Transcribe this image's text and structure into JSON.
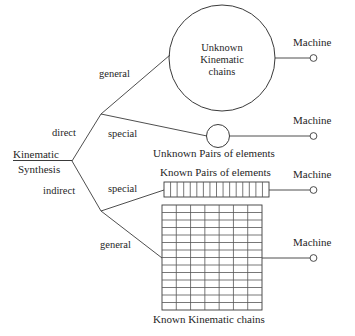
{
  "diagram": {
    "root": {
      "line1": "Kinematic",
      "line2": "Synthesis"
    },
    "branches": [
      {
        "id": "direct",
        "label": "direct"
      },
      {
        "id": "indirect",
        "label": "indirect"
      }
    ],
    "sub_branches": [
      {
        "id": "direct-general",
        "label": "general"
      },
      {
        "id": "direct-special",
        "label": "special"
      },
      {
        "id": "indirect-special",
        "label": "special"
      },
      {
        "id": "indirect-general",
        "label": "general"
      }
    ],
    "nodes": [
      {
        "id": "unknown-kinematic-chains",
        "shape": "large-circle",
        "text_lines": [
          "Unknown",
          "Kinematic",
          "chains"
        ],
        "caption": ""
      },
      {
        "id": "unknown-pairs-of-elements",
        "shape": "small-circle",
        "text_lines": [],
        "caption": "Unknown Pairs of elements"
      },
      {
        "id": "known-pairs-of-elements",
        "shape": "cell-strip",
        "text_lines": [],
        "caption": "Known Pairs of elements",
        "cells": 16
      },
      {
        "id": "known-kinematic-chains",
        "shape": "grid",
        "text_lines": [],
        "caption": "Known Kinematic chains",
        "columns": 7,
        "rows": 14
      }
    ],
    "outputs": [
      {
        "id": "machine-1",
        "label": "Machine"
      },
      {
        "id": "machine-2",
        "label": "Machine"
      },
      {
        "id": "machine-3",
        "label": "Machine"
      },
      {
        "id": "machine-4",
        "label": "Machine"
      }
    ],
    "colors": {
      "stroke": "#3a3a3a",
      "grid_stroke": "#555555",
      "text": "#1f1f1f",
      "background": "#ffffff"
    }
  }
}
